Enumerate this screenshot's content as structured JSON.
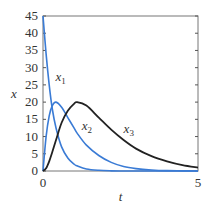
{
  "chart_data": {
    "type": "line",
    "title": "",
    "xlabel": "t",
    "ylabel": "x",
    "xlim": [
      0,
      5
    ],
    "ylim": [
      0,
      45
    ],
    "xticks": [
      0,
      5
    ],
    "yticks": [
      0,
      5,
      10,
      15,
      20,
      25,
      30,
      35,
      40,
      45
    ],
    "grid": false,
    "legend": "inline labels",
    "x": [
      0,
      0.1,
      0.2,
      0.3,
      0.42,
      0.6,
      0.8,
      1.0,
      1.1,
      1.4,
      1.8,
      2.2,
      2.6,
      3.0,
      3.5,
      4.0,
      4.5,
      5.0
    ],
    "series": [
      {
        "name": "x1",
        "label": "x",
        "sub": "1",
        "color": "#3a7bd5",
        "values": [
          45,
          34,
          25,
          18,
          12.5,
          7,
          3.8,
          2,
          1.5,
          0.6,
          0.2,
          0.05,
          0,
          0,
          0,
          0,
          0,
          0
        ]
      },
      {
        "name": "x2",
        "label": "x",
        "sub": "2",
        "color": "#3a7bd5",
        "values": [
          0,
          10,
          16,
          19,
          20,
          18.5,
          15.5,
          12.5,
          11,
          7.5,
          4.5,
          2.5,
          1.3,
          0.7,
          0.3,
          0.1,
          0.05,
          0
        ]
      },
      {
        "name": "x3",
        "label": "x",
        "sub": "3",
        "color": "#222222",
        "values": [
          0,
          0.8,
          2.8,
          5.5,
          9,
          14,
          17.5,
          19.5,
          20,
          19,
          15.5,
          12,
          9,
          6.5,
          4.3,
          2.8,
          1.7,
          1
        ]
      }
    ],
    "annotations": [
      {
        "text": "x1",
        "t": 0.4,
        "y": 26
      },
      {
        "text": "x2",
        "t": 1.25,
        "y": 12
      },
      {
        "text": "x3",
        "t": 2.6,
        "y": 11
      }
    ]
  }
}
